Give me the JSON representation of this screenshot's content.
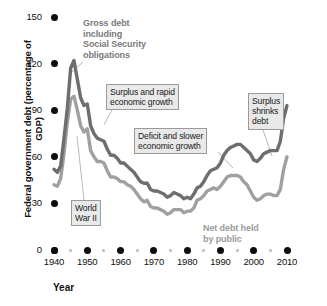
{
  "chart_data": {
    "type": "line",
    "title": "",
    "xlabel": "Year",
    "ylabel": "Federal government debt (percentage of GDP)",
    "xlim": [
      1939,
      2011
    ],
    "ylim": [
      0,
      150
    ],
    "yticks": [
      0,
      30,
      60,
      90,
      120,
      150
    ],
    "ytick_labels": [
      "0",
      "30",
      "60",
      "90",
      "120",
      "150"
    ],
    "xticks": [
      1940,
      1950,
      1960,
      1970,
      1980,
      1990,
      2000,
      2010
    ],
    "xtick_labels": [
      "1940",
      "1950",
      "1960",
      "1970",
      "1980",
      "1990",
      "2000",
      "2010"
    ],
    "xminor_ticks": [
      1945,
      1955,
      1965,
      1975,
      1985,
      1995,
      2005
    ],
    "grid": false,
    "legend": "inline-labels",
    "series": [
      {
        "name": "Gross debt including Social Security obligations",
        "color": "#6e6e6e",
        "x": [
          1940,
          1941,
          1942,
          1943,
          1944,
          1945,
          1946,
          1947,
          1948,
          1949,
          1950,
          1951,
          1952,
          1953,
          1954,
          1955,
          1956,
          1957,
          1958,
          1959,
          1960,
          1961,
          1962,
          1963,
          1964,
          1965,
          1966,
          1967,
          1968,
          1969,
          1970,
          1971,
          1972,
          1973,
          1974,
          1975,
          1976,
          1977,
          1978,
          1979,
          1980,
          1981,
          1982,
          1983,
          1984,
          1985,
          1986,
          1987,
          1988,
          1989,
          1990,
          1991,
          1992,
          1993,
          1994,
          1995,
          1996,
          1997,
          1998,
          1999,
          2000,
          2001,
          2002,
          2003,
          2004,
          2005,
          2006,
          2007,
          2008,
          2009,
          2010
        ],
        "y": [
          52,
          50,
          54,
          72,
          91,
          117,
          122,
          110,
          98,
          93,
          94,
          80,
          75,
          72,
          71,
          70,
          65,
          61,
          61,
          59,
          56,
          56,
          54,
          52,
          50,
          47,
          44,
          43,
          43,
          39,
          38,
          38,
          37,
          36,
          34,
          35,
          37,
          36,
          35,
          33,
          34,
          33,
          36,
          40,
          41,
          44,
          48,
          51,
          52,
          53,
          56,
          61,
          64,
          66,
          67,
          68,
          68,
          66,
          64,
          62,
          58,
          57,
          59,
          62,
          63,
          64,
          64,
          64,
          70,
          85,
          93
        ],
        "label_text": "Gross debt including Social Security obligations"
      },
      {
        "name": "Net debt held by public",
        "color": "#a0a0a0",
        "x": [
          1940,
          1941,
          1942,
          1943,
          1944,
          1945,
          1946,
          1947,
          1948,
          1949,
          1950,
          1951,
          1952,
          1953,
          1954,
          1955,
          1956,
          1957,
          1958,
          1959,
          1960,
          1961,
          1962,
          1963,
          1964,
          1965,
          1966,
          1967,
          1968,
          1969,
          1970,
          1971,
          1972,
          1973,
          1974,
          1975,
          1976,
          1977,
          1978,
          1979,
          1980,
          1981,
          1982,
          1983,
          1984,
          1985,
          1986,
          1987,
          1988,
          1989,
          1990,
          1991,
          1992,
          1993,
          1994,
          1995,
          1996,
          1997,
          1998,
          1999,
          2000,
          2001,
          2002,
          2003,
          2004,
          2005,
          2006,
          2007,
          2008,
          2009,
          2010
        ],
        "y": [
          42,
          41,
          46,
          62,
          82,
          97,
          99,
          90,
          80,
          76,
          78,
          64,
          60,
          57,
          57,
          56,
          51,
          47,
          47,
          46,
          44,
          44,
          42,
          41,
          39,
          36,
          33,
          31,
          32,
          28,
          27,
          27,
          26,
          25,
          23,
          24,
          26,
          26,
          26,
          24,
          25,
          25,
          27,
          32,
          33,
          35,
          38,
          39,
          40,
          39,
          41,
          44,
          47,
          48,
          48,
          48,
          47,
          44,
          42,
          38,
          34,
          32,
          33,
          35,
          36,
          36,
          35,
          35,
          39,
          52,
          60
        ],
        "label_text": "Net debt held by public"
      }
    ],
    "annotations": [
      {
        "id": "gross-debt-label",
        "text": "Gross debt\nincluding\nSocial Security\nobligations",
        "style": "plain-bold-gray",
        "target_year": 1946,
        "target_value": 122
      },
      {
        "id": "net-debt-label",
        "text": "Net debt held\nby public",
        "style": "plain-bold-gray",
        "target_year": 1985,
        "target_value": 36
      },
      {
        "id": "surplus-rapid-growth",
        "text": "Surplus and rapid\neconomic growth",
        "style": "boxed",
        "target_year": 1954,
        "target_value": 72
      },
      {
        "id": "deficit-slower-growth",
        "text": "Deficit and slower\neconomic growth",
        "style": "boxed",
        "target_year": 1984,
        "target_value": 41
      },
      {
        "id": "surplus-shrinks-debt",
        "text": "Surplus\nshrinks\ndebt",
        "style": "boxed",
        "target_year": 2000,
        "target_value": 58
      },
      {
        "id": "world-war-two",
        "text": "World\nWar II",
        "style": "boxed",
        "target_year": 1944,
        "target_value": 91
      }
    ]
  },
  "axes": {
    "y_title": "Federal government debt (percentage of GDP)",
    "x_title": "Year",
    "y_labels": [
      "150",
      "120",
      "90",
      "60",
      "30",
      "0"
    ],
    "x_labels": [
      "1940",
      "1950",
      "1960",
      "1970",
      "1980",
      "1990",
      "2000",
      "2010"
    ]
  },
  "annotations": {
    "gross_debt": "Gross debt\nincluding\nSocial Security\nobligations",
    "net_debt": "Net debt held\nby public",
    "surplus_rapid": "Surplus and rapid\neconomic growth",
    "deficit_slower": "Deficit and slower\neconomic growth",
    "surplus_shrinks": "Surplus\nshrinks\ndebt",
    "world_war_two": "World\nWar II"
  },
  "colors": {
    "gross_line": "#6e6e6e",
    "net_line": "#a0a0a0",
    "tick_dot": "#0d0d0d",
    "minor_dot": "#b9b9b9",
    "callout_bg": "#e9e9e9",
    "callout_border": "#9a9a9a",
    "text": "#111111"
  }
}
